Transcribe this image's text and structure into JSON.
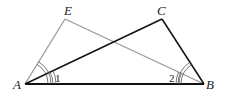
{
  "diagram": {
    "type": "geometry",
    "points": {
      "A": {
        "label": "A",
        "x": 25,
        "y": 84
      },
      "B": {
        "label": "B",
        "x": 204,
        "y": 84
      },
      "C": {
        "label": "C",
        "x": 162,
        "y": 19
      },
      "E": {
        "label": "E",
        "x": 65,
        "y": 19
      }
    },
    "angle_labels": {
      "angle1": "1",
      "angle2": "2"
    },
    "segments": [
      {
        "from": "A",
        "to": "B",
        "color": "#111111"
      },
      {
        "from": "A",
        "to": "C",
        "color": "#111111"
      },
      {
        "from": "C",
        "to": "B",
        "color": "#111111"
      },
      {
        "from": "A",
        "to": "E",
        "color": "#999999"
      },
      {
        "from": "E",
        "to": "B",
        "color": "#999999"
      }
    ],
    "colors": {
      "dark": "#111111",
      "gray": "#999999"
    }
  }
}
